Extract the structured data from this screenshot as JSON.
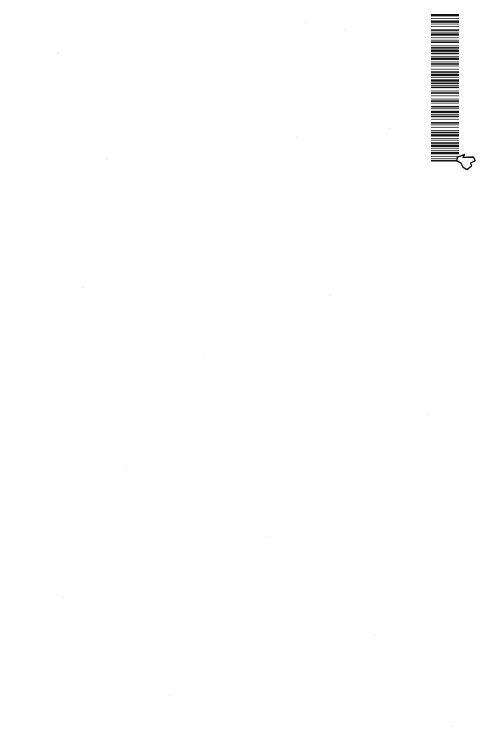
{
  "page": {
    "kind": "scanned-page",
    "background_color": "#ffffff",
    "ink_color": "#111111",
    "width": 486,
    "height": 756,
    "body_text": ""
  },
  "label": {
    "name": "barcode-label",
    "orientation": "rotated-90-ccw",
    "code_text": "W9-CAB-500",
    "barcode": {
      "icon_name": "barcode-icon",
      "symbology_look": "code-39-style",
      "bar_color": "#111111",
      "background_color": "#ffffff",
      "module_pattern": [
        3,
        2,
        1,
        2,
        3,
        1,
        1,
        2,
        1,
        3,
        2,
        1,
        1,
        1,
        3,
        2,
        1,
        2,
        1,
        1,
        2,
        3,
        1,
        1,
        2,
        1,
        3,
        1,
        2,
        2,
        1,
        1,
        3,
        2,
        1,
        1,
        2,
        1,
        1,
        3,
        1,
        2,
        2,
        1,
        3,
        1,
        1,
        2,
        3,
        1,
        2,
        1,
        1,
        1,
        2,
        3,
        1,
        1,
        2,
        2,
        1,
        3,
        1,
        1,
        2,
        1,
        1,
        3,
        2,
        1,
        1,
        2,
        3,
        1,
        1,
        1,
        2,
        2,
        1,
        3,
        2,
        1,
        1,
        2,
        1,
        3,
        1,
        1,
        2,
        1,
        3,
        2,
        1,
        1,
        1,
        2,
        2,
        1,
        3,
        1,
        1,
        2,
        1,
        1,
        3,
        2,
        1,
        2,
        1,
        1,
        2,
        3
      ]
    },
    "glyph": {
      "icon_name": "pointing-hand-icon",
      "description": "small outlined hand / arrow mark",
      "stroke_color": "#111111",
      "fill_color": "#ffffff"
    }
  }
}
